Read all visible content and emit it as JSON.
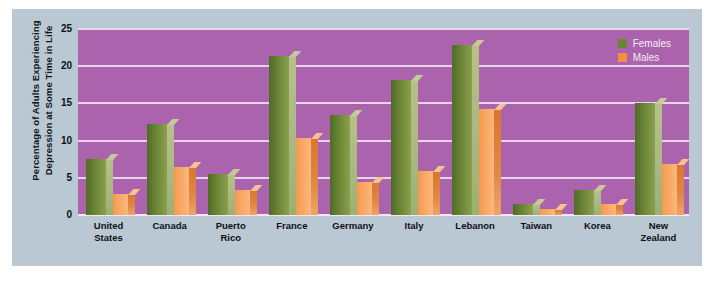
{
  "chart_data": {
    "type": "bar",
    "title": "",
    "xlabel": "",
    "ylabel": "Percentage of Adults Experiencing Depression at Some Time in Life",
    "ylim": [
      0,
      25
    ],
    "yticks": [
      0,
      5,
      10,
      15,
      20,
      25
    ],
    "grid": true,
    "legend_position": "top-right",
    "categories": [
      "United States",
      "Canada",
      "Puerto Rico",
      "France",
      "Germany",
      "Italy",
      "Lebanon",
      "Taiwan",
      "Korea",
      "New Zealand"
    ],
    "series": [
      {
        "name": "Females",
        "color": "#6b8535",
        "values": [
          7.5,
          12.2,
          5.5,
          21.4,
          13.4,
          18.2,
          22.9,
          1.5,
          3.4,
          15.0
        ]
      },
      {
        "name": "Males",
        "color": "#f2903f",
        "values": [
          2.8,
          6.4,
          3.4,
          10.4,
          4.5,
          5.9,
          14.3,
          0.8,
          1.5,
          6.9
        ]
      }
    ]
  },
  "legend": {
    "items": [
      {
        "label": "Females",
        "color": "#6b8535"
      },
      {
        "label": "Males",
        "color": "#f2903f"
      }
    ]
  },
  "colors": {
    "plot_background": "#ab63ad",
    "card_background": "#b9c8d3",
    "gridline": "#e7d3ea"
  }
}
